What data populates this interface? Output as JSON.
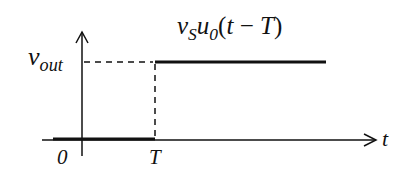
{
  "diagram": {
    "type": "delayed-step-function-plot",
    "curve_label": {
      "v": "v",
      "v_sub": "S",
      "u": "u",
      "u_sub": "0",
      "arg_open": "(",
      "arg_t": "t",
      "arg_minus": " − ",
      "arg_T": "T",
      "arg_close": ")"
    },
    "y_axis_label": {
      "main": "v",
      "sub": "out"
    },
    "x_axis_label": "t",
    "ticks": {
      "origin": "0",
      "delay": "T"
    },
    "colors": {
      "line": "#111111",
      "background": "#ffffff"
    }
  }
}
